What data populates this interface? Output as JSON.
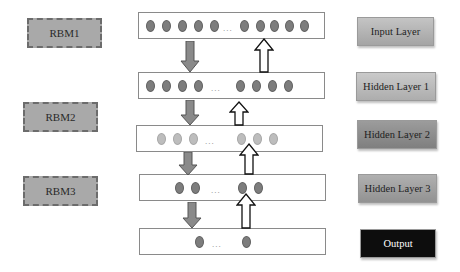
{
  "rbms": [
    {
      "label": "RBM1"
    },
    {
      "label": "RBM2"
    },
    {
      "label": "RBM3"
    }
  ],
  "layers": [
    {
      "name": "Input Layer",
      "color": "#b0b0b0",
      "text_color": "#1e1e1e",
      "left_nodes": 5,
      "right_nodes": 5
    },
    {
      "name": "Hidden Layer 1",
      "color": "#b8b8b8",
      "text_color": "#1e1e1e",
      "left_nodes": 4,
      "right_nodes": 4
    },
    {
      "name": "Hidden Layer 2",
      "color": "#8e8e8e",
      "text_color": "#1e1e1e",
      "left_nodes": 3,
      "right_nodes": 3
    },
    {
      "name": "Hidden Layer 3",
      "color": "#a0a0a0",
      "text_color": "#1e1e1e",
      "left_nodes": 2,
      "right_nodes": 2
    },
    {
      "name": "Output",
      "color": "#0d0d0d",
      "text_color": "#ffffff",
      "left_nodes": 1,
      "right_nodes": 1
    }
  ],
  "ellipsis": "...",
  "colors": {
    "node": "#7d7d7d",
    "node_light": "#bdbdbd",
    "down_arrow": "#8a8a8a",
    "up_arrow": "#ffffff"
  }
}
